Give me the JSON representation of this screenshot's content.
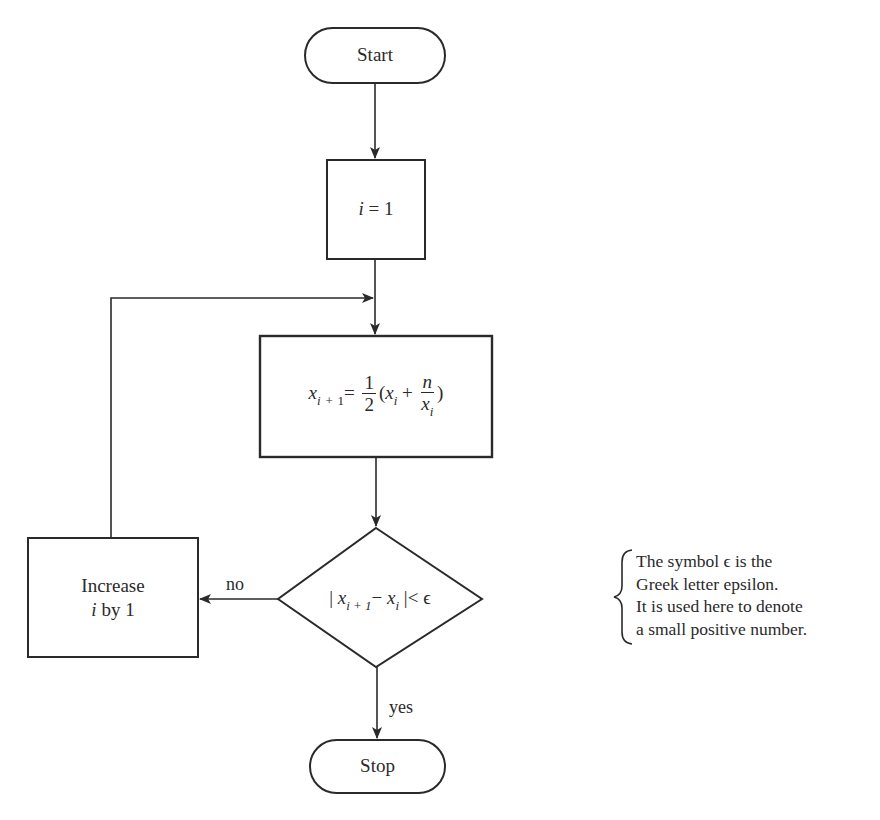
{
  "diagram": {
    "type": "flowchart",
    "title": "",
    "nodes": {
      "start": {
        "shape": "terminal",
        "label": "Start"
      },
      "init": {
        "shape": "process",
        "label_var": "i",
        "label_op": "=",
        "label_val": "1"
      },
      "update": {
        "shape": "process",
        "lhs_var": "x",
        "lhs_sub_i": "i",
        "lhs_sub_plus": "+",
        "lhs_sub_one": "1",
        "equals": "=",
        "frac_num": "1",
        "frac_den": "2",
        "paren_open": "(",
        "xi_var": "x",
        "xi_sub": "i",
        "plus": "+",
        "inner_num": "n",
        "inner_den_var": "x",
        "inner_den_sub": "i",
        "paren_close": ")"
      },
      "test": {
        "shape": "decision",
        "bar_open": "|",
        "x1_var": "x",
        "x1_sub": "i + 1",
        "minus": "−",
        "x2_var": "x",
        "x2_sub": "i",
        "bar_close": "|",
        "lt": "<",
        "eps": "ϵ"
      },
      "increment": {
        "shape": "process",
        "line1": "Increase",
        "line2_var": "i",
        "line2_rest": " by 1"
      },
      "stop": {
        "shape": "terminal",
        "label": "Stop"
      }
    },
    "edges": [
      {
        "from": "start",
        "to": "init",
        "label": ""
      },
      {
        "from": "init",
        "to": "update",
        "label": ""
      },
      {
        "from": "update",
        "to": "test",
        "label": ""
      },
      {
        "from": "test",
        "to": "increment",
        "label": "no"
      },
      {
        "from": "increment",
        "to": "update",
        "label": ""
      },
      {
        "from": "test",
        "to": "stop",
        "label": "yes"
      }
    ],
    "edge_labels": {
      "no": "no",
      "yes": "yes"
    },
    "note": {
      "lines": [
        "The symbol ϵ is the",
        "Greek letter epsilon.",
        "It is used here to denote",
        "a small positive number."
      ]
    },
    "colors": {
      "stroke": "#2a2a2a",
      "background": "#ffffff",
      "text": "#2a2a2a"
    }
  }
}
